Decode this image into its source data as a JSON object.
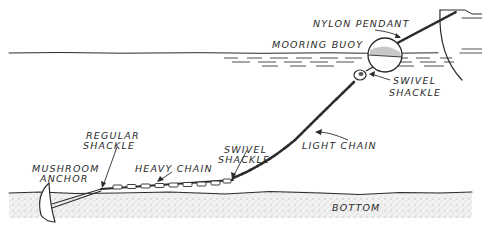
{
  "diagram": {
    "labels": {
      "nylon_pendant": "NYLON PENDANT",
      "mooring_buoy": "MOORING BUOY",
      "swivel_shackle_top_1": "SWIVEL",
      "swivel_shackle_top_2": "SHACKLE",
      "regular_shackle_1": "REGULAR",
      "regular_shackle_2": "SHACKLE",
      "swivel_shackle_bottom_1": "SWIVEL",
      "swivel_shackle_bottom_2": "SHACKLE",
      "light_chain": "LIGHT CHAIN",
      "mushroom_anchor_1": "MUSHROOM",
      "mushroom_anchor_2": "ANCHOR",
      "heavy_chain": "HEAVY CHAIN",
      "bottom": "BOTTOM"
    },
    "colors": {
      "ink": "#2b2b2b",
      "seabed": "#d8d8d8",
      "background": "#ffffff"
    }
  }
}
